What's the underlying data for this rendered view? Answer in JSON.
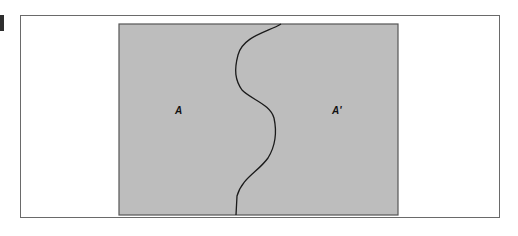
{
  "diagram": {
    "regions": [
      {
        "id": "left",
        "label": "A"
      },
      {
        "id": "right",
        "label": "A'"
      }
    ],
    "colors": {
      "region_fill": "#bdbdbd",
      "region_border": "#555555",
      "boundary_curve": "#1a1a1a",
      "frame_border": "#6a6a6a",
      "marker": "#2e2e2e"
    }
  }
}
